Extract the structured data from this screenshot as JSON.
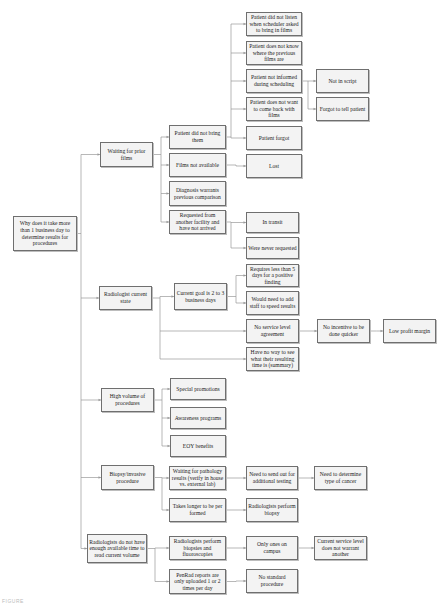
{
  "diagram": {
    "type": "why-tree / cause-and-effect",
    "root": {
      "id": "root",
      "label": "Why does it take more than 1 business day to determine results for procedures"
    },
    "nodes": [
      {
        "id": "root",
        "label": "Why does it take more than 1 business day to determine results for procedures",
        "x": 13,
        "y": 216,
        "w": 64,
        "h": 35
      },
      {
        "id": "n_wait",
        "label": "Waiting for prior films",
        "x": 100,
        "y": 142,
        "w": 53,
        "h": 25
      },
      {
        "id": "n_pdnb",
        "label": "Patient did not bring them",
        "x": 169,
        "y": 125,
        "w": 57,
        "h": 24
      },
      {
        "id": "n_fna",
        "label": "Films not available",
        "x": 169,
        "y": 153,
        "w": 57,
        "h": 24
      },
      {
        "id": "n_diag",
        "label": "Diagnosis warrants previous comparison",
        "x": 169,
        "y": 181,
        "w": 57,
        "h": 25
      },
      {
        "id": "n_req",
        "label": "Requested from another facility and have not arrived",
        "x": 169,
        "y": 210,
        "w": 57,
        "h": 24
      },
      {
        "id": "n_listen",
        "label": "Patient did not listen when scheduler asked to bring in films",
        "x": 246,
        "y": 12,
        "w": 56,
        "h": 24
      },
      {
        "id": "n_know",
        "label": "Patient does not know where the previous films are",
        "x": 246,
        "y": 41,
        "w": 56,
        "h": 24
      },
      {
        "id": "n_inform",
        "label": "Patient not informed during scheduling",
        "x": 246,
        "y": 69,
        "w": 56,
        "h": 24
      },
      {
        "id": "n_want",
        "label": "Patient does not want to come back with films",
        "x": 246,
        "y": 97,
        "w": 56,
        "h": 24
      },
      {
        "id": "n_forgot",
        "label": "Patient forgot",
        "x": 246,
        "y": 126,
        "w": 56,
        "h": 24
      },
      {
        "id": "n_lost",
        "label": "Lost",
        "x": 246,
        "y": 154,
        "w": 56,
        "h": 24
      },
      {
        "id": "n_script",
        "label": "Not in script",
        "x": 316,
        "y": 69,
        "w": 53,
        "h": 24
      },
      {
        "id": "n_tell",
        "label": "Forgot to tell patient",
        "x": 316,
        "y": 97,
        "w": 53,
        "h": 24
      },
      {
        "id": "n_transit",
        "label": "In transit",
        "x": 246,
        "y": 212,
        "w": 53,
        "h": 21
      },
      {
        "id": "n_never",
        "label": "Were never requested",
        "x": 246,
        "y": 237,
        "w": 53,
        "h": 22
      },
      {
        "id": "n_rad",
        "label": "Radiologist current state",
        "x": 99,
        "y": 286,
        "w": 53,
        "h": 24
      },
      {
        "id": "n_goal",
        "label": "Current goal is 2 to 3 business days",
        "x": 174,
        "y": 283,
        "w": 53,
        "h": 27
      },
      {
        "id": "n_req5",
        "label": "Requires less than 5 days for a positive finding",
        "x": 246,
        "y": 264,
        "w": 53,
        "h": 23
      },
      {
        "id": "n_staff",
        "label": "Would need to add staff to speed results",
        "x": 246,
        "y": 291,
        "w": 53,
        "h": 24
      },
      {
        "id": "n_sla",
        "label": "No service level agreement",
        "x": 246,
        "y": 319,
        "w": 53,
        "h": 24
      },
      {
        "id": "n_see",
        "label": "Have no way to see what their resulting time is (summary)",
        "x": 246,
        "y": 347,
        "w": 53,
        "h": 24
      },
      {
        "id": "n_incent",
        "label": "No incentive to be done quicker",
        "x": 317,
        "y": 319,
        "w": 53,
        "h": 24
      },
      {
        "id": "n_profit",
        "label": "Low profit margin",
        "x": 383,
        "y": 319,
        "w": 53,
        "h": 24
      },
      {
        "id": "n_vol",
        "label": "High volume of procedures",
        "x": 101,
        "y": 388,
        "w": 53,
        "h": 24
      },
      {
        "id": "n_promo",
        "label": "Special promotions",
        "x": 170,
        "y": 378,
        "w": 56,
        "h": 22
      },
      {
        "id": "n_aware",
        "label": "Awareness programs",
        "x": 170,
        "y": 407,
        "w": 56,
        "h": 22
      },
      {
        "id": "n_eoy",
        "label": "EOY benefits",
        "x": 170,
        "y": 435,
        "w": 56,
        "h": 22
      },
      {
        "id": "n_biopsy",
        "label": "Biopsy/invasive procedure",
        "x": 101,
        "y": 465,
        "w": 53,
        "h": 25
      },
      {
        "id": "n_path",
        "label": "Waiting for pathology results (verify in house vs. external lab)",
        "x": 169,
        "y": 466,
        "w": 57,
        "h": 24
      },
      {
        "id": "n_longer",
        "label": "Takes longer to be per formed",
        "x": 169,
        "y": 498,
        "w": 57,
        "h": 24
      },
      {
        "id": "n_sendout",
        "label": "Need to send out for additional testing",
        "x": 246,
        "y": 466,
        "w": 52,
        "h": 24
      },
      {
        "id": "n_cancer",
        "label": "Need to determine type of cancer",
        "x": 314,
        "y": 466,
        "w": 53,
        "h": 24
      },
      {
        "id": "n_perf",
        "label": "Radiologists perform biopsy",
        "x": 246,
        "y": 498,
        "w": 52,
        "h": 24
      },
      {
        "id": "n_time",
        "label": "Radiologists do not have enough available time to read current volume",
        "x": 87,
        "y": 534,
        "w": 60,
        "h": 29
      },
      {
        "id": "n_fluoro",
        "label": "Radiologists perform biopsies and fluoroscopies",
        "x": 169,
        "y": 536,
        "w": 57,
        "h": 24
      },
      {
        "id": "n_penrad",
        "label": "PenRad reports are only uploaded 1 or 2 times per day",
        "x": 169,
        "y": 569,
        "w": 57,
        "h": 25
      },
      {
        "id": "n_campus",
        "label": "Only ones on campus",
        "x": 246,
        "y": 536,
        "w": 52,
        "h": 24
      },
      {
        "id": "n_nostd",
        "label": "No standard procedure",
        "x": 246,
        "y": 569,
        "w": 52,
        "h": 24
      },
      {
        "id": "n_svc",
        "label": "Current service level does not warrant another",
        "x": 314,
        "y": 536,
        "w": 53,
        "h": 24
      }
    ],
    "edges": [
      [
        "root",
        "n_wait"
      ],
      [
        "root",
        "n_rad"
      ],
      [
        "root",
        "n_vol"
      ],
      [
        "root",
        "n_biopsy"
      ],
      [
        "root",
        "n_time"
      ],
      [
        "n_wait",
        "n_pdnb"
      ],
      [
        "n_wait",
        "n_fna"
      ],
      [
        "n_wait",
        "n_diag"
      ],
      [
        "n_wait",
        "n_req"
      ],
      [
        "n_pdnb",
        "n_listen"
      ],
      [
        "n_pdnb",
        "n_know"
      ],
      [
        "n_pdnb",
        "n_inform"
      ],
      [
        "n_pdnb",
        "n_want"
      ],
      [
        "n_pdnb",
        "n_forgot"
      ],
      [
        "n_inform",
        "n_script"
      ],
      [
        "n_inform",
        "n_tell"
      ],
      [
        "n_fna",
        "n_lost"
      ],
      [
        "n_req",
        "n_transit"
      ],
      [
        "n_req",
        "n_never"
      ],
      [
        "n_rad",
        "n_goal"
      ],
      [
        "n_rad",
        "n_sla"
      ],
      [
        "n_rad",
        "n_see"
      ],
      [
        "n_goal",
        "n_req5"
      ],
      [
        "n_goal",
        "n_staff"
      ],
      [
        "n_sla",
        "n_incent"
      ],
      [
        "n_incent",
        "n_profit"
      ],
      [
        "n_vol",
        "n_promo"
      ],
      [
        "n_vol",
        "n_aware"
      ],
      [
        "n_vol",
        "n_eoy"
      ],
      [
        "n_biopsy",
        "n_path"
      ],
      [
        "n_biopsy",
        "n_longer"
      ],
      [
        "n_path",
        "n_sendout"
      ],
      [
        "n_sendout",
        "n_cancer"
      ],
      [
        "n_longer",
        "n_perf"
      ],
      [
        "n_time",
        "n_fluoro"
      ],
      [
        "n_time",
        "n_penrad"
      ],
      [
        "n_fluoro",
        "n_campus"
      ],
      [
        "n_campus",
        "n_svc"
      ],
      [
        "n_penrad",
        "n_nostd"
      ]
    ],
    "buses": {
      "root": 81,
      "n_wait": 161,
      "n_pdnb": 231,
      "n_inform": 308,
      "n_req": 231,
      "n_rad": 160,
      "n_goal": 236,
      "n_vol": 162,
      "n_biopsy": 162,
      "n_time": 155
    },
    "colors": {
      "box_border": "#6f6f6f",
      "box_fill": "#f3f3f3",
      "line": "#9a9a9a",
      "text": "#222222"
    }
  },
  "caption": "FIGURE"
}
